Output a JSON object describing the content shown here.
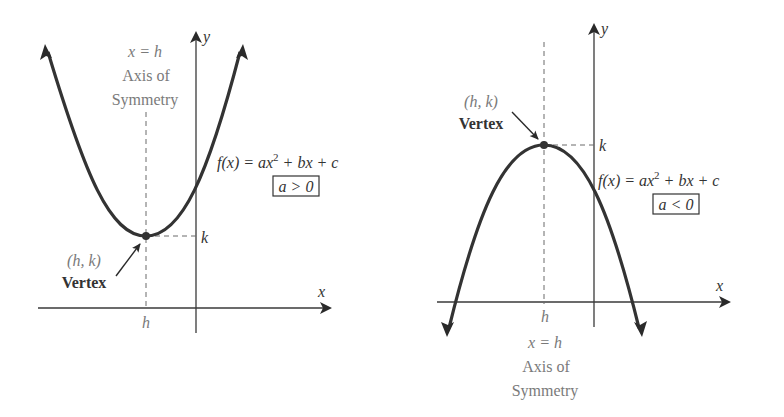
{
  "colors": {
    "curve": "#333333",
    "axis": "#3a3a3a",
    "dash": "#6a6a6a",
    "label_dark": "#333333",
    "label_gray": "#7a7a7a",
    "background": "#ffffff"
  },
  "left_graph": {
    "name": "upward-parabola",
    "axis_x_label": "x",
    "axis_y_label": "y",
    "h_label": "h",
    "k_label": "k",
    "symmetry_eq": "x = h",
    "symmetry_line1": "Axis of",
    "symmetry_line2": "Symmetry",
    "vertex_coord": "(h, k)",
    "vertex_label": "Vertex",
    "function_label": "f(x) = ax",
    "function_exp": "2",
    "function_tail": " + bx + c",
    "condition": "a > 0"
  },
  "right_graph": {
    "name": "downward-parabola",
    "axis_x_label": "x",
    "axis_y_label": "y",
    "h_label": "h",
    "k_label": "k",
    "symmetry_eq": "x = h",
    "symmetry_line1": "Axis of",
    "symmetry_line2": "Symmetry",
    "vertex_coord": "(h, k)",
    "vertex_label": "Vertex",
    "function_label": "f(x) = ax",
    "function_exp": "2",
    "function_tail": " + bx + c",
    "condition": "a < 0"
  }
}
